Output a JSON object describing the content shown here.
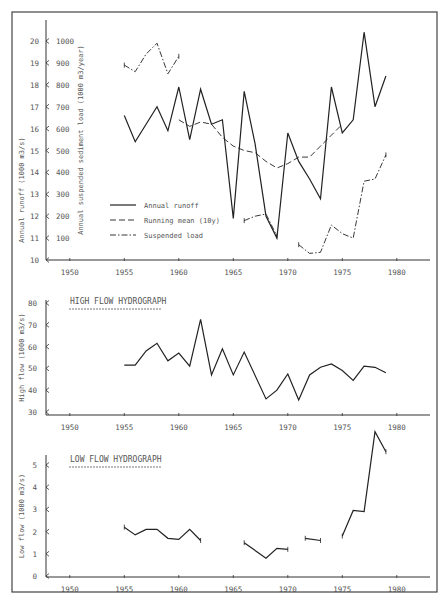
{
  "chart_data": [
    {
      "type": "line",
      "title": "",
      "xlabel": "",
      "ylabel": "Annual runoff (1000 m3/s)",
      "ylabel_right": "Annual suspended sediment load (1000 m3/year)",
      "xlim": [
        1947,
        1983
      ],
      "ylim": [
        10,
        20
      ],
      "ylim_secondary": [
        0,
        1000
      ],
      "x_ticks": [
        1950,
        1955,
        1960,
        1965,
        1970,
        1975,
        1980
      ],
      "y_ticks": [
        10,
        11,
        12,
        13,
        14,
        15,
        16,
        17,
        18,
        19,
        20
      ],
      "y_ticks_secondary": [
        100,
        200,
        300,
        400,
        500,
        600,
        700,
        800,
        900,
        1000
      ],
      "legend": [
        "Annual runoff",
        "Running mean (10y)",
        "Suspended load"
      ],
      "legend_position": "lower-left",
      "grid": false,
      "series": [
        {
          "name": "Annual runoff",
          "style": "solid",
          "axis": "left",
          "x": [
            1955,
            1956,
            1958,
            1959,
            1960,
            1961,
            1962,
            1963,
            1964,
            1965,
            1966,
            1967,
            1968,
            1969,
            1970,
            1971,
            1972,
            1973,
            1974,
            1975,
            1976,
            1977,
            1978,
            1979
          ],
          "values": [
            16.6,
            15.4,
            17.0,
            15.9,
            17.9,
            15.5,
            17.8,
            16.2,
            16.4,
            11.9,
            17.7,
            15.3,
            12.0,
            11.0,
            15.8,
            14.5,
            13.7,
            12.8,
            17.9,
            15.8,
            16.4,
            20.4,
            17.0,
            18.4
          ]
        },
        {
          "name": "Running mean (10y)",
          "style": "dashed",
          "axis": "left",
          "x": [
            1960,
            1961,
            1962,
            1963,
            1964,
            1965,
            1966,
            1967,
            1968,
            1969,
            1970,
            1971,
            1972,
            1973,
            1974,
            1975
          ],
          "values": [
            16.4,
            16.1,
            16.3,
            16.2,
            15.6,
            15.2,
            15.0,
            14.9,
            14.5,
            14.2,
            14.4,
            14.7,
            14.7,
            15.2,
            15.7,
            16.2
          ]
        },
        {
          "name": "Suspended load",
          "style": "dashdot",
          "axis": "right",
          "segments": [
            {
              "x": [
                1955,
                1956,
                1957,
                1958,
                1959,
                1960
              ],
              "values": [
                890,
                860,
                940,
                990,
                850,
                930
              ]
            },
            {
              "x": [
                1966,
                1967,
                1968,
                1969
              ],
              "values": [
                180,
                200,
                210,
                110
              ]
            },
            {
              "x": [
                1971,
                1972,
                1973,
                1974,
                1975,
                1976,
                1977,
                1978,
                1979
              ],
              "values": [
                70,
                30,
                35,
                160,
                120,
                100,
                360,
                370,
                480
              ]
            }
          ]
        }
      ]
    },
    {
      "type": "line",
      "title": "HIGH FLOW HYDROGRAPH",
      "xlabel": "",
      "ylabel": "High flow (1000 m3/s)",
      "xlim": [
        1947,
        1983
      ],
      "ylim": [
        30,
        80
      ],
      "x_ticks": [
        1950,
        1955,
        1960,
        1965,
        1970,
        1975,
        1980
      ],
      "y_ticks": [
        30,
        40,
        50,
        60,
        70,
        80
      ],
      "grid": false,
      "series": [
        {
          "name": "High flow",
          "x": [
            1955,
            1956,
            1957,
            1958,
            1959,
            1960,
            1961,
            1962,
            1963,
            1964,
            1965,
            1966,
            1968,
            1969,
            1970,
            1971,
            1972,
            1973,
            1974,
            1975,
            1976,
            1977,
            1978,
            1979
          ],
          "values": [
            51.5,
            51.5,
            58,
            61.5,
            53.5,
            57,
            51,
            72.5,
            47,
            59,
            47,
            57.5,
            36,
            40,
            47.5,
            35.5,
            47,
            50.5,
            52,
            49,
            44.5,
            51,
            50.5,
            48
          ]
        }
      ]
    },
    {
      "type": "line",
      "title": "LOW FLOW HYDROGRAPH",
      "xlabel": "",
      "ylabel": "Low flow (1000 m3/s)",
      "xlim": [
        1947,
        1983
      ],
      "ylim": [
        0,
        5.5
      ],
      "x_ticks": [
        1950,
        1955,
        1960,
        1965,
        1970,
        1975,
        1980
      ],
      "y_ticks": [
        0,
        1,
        2,
        3,
        4,
        5
      ],
      "grid": false,
      "series": [
        {
          "name": "Low flow",
          "segments": [
            {
              "x": [
                1955,
                1956,
                1957,
                1958,
                1959,
                1960,
                1961,
                1962
              ],
              "values": [
                2.2,
                1.85,
                2.1,
                2.1,
                1.7,
                1.65,
                2.1,
                1.6
              ]
            },
            {
              "x": [
                1966,
                1968,
                1969,
                1970
              ],
              "values": [
                1.5,
                0.8,
                1.25,
                1.2
              ]
            },
            {
              "x": [
                1971.6,
                1973
              ],
              "values": [
                1.7,
                1.6
              ]
            },
            {
              "x": [
                1975,
                1976,
                1977,
                1978,
                1979
              ],
              "values": [
                1.8,
                2.95,
                2.9,
                6.5,
                5.6
              ]
            }
          ]
        }
      ]
    }
  ]
}
